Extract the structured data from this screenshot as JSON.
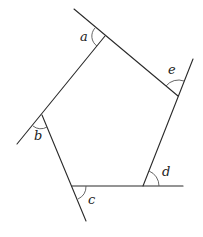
{
  "diagram": {
    "type": "pentagon-exterior-angles",
    "labels": {
      "a": "a",
      "b": "b",
      "c": "c",
      "d": "d",
      "e": "e"
    },
    "vertices": {
      "A": [
        105,
        36
      ],
      "E": [
        178,
        96
      ],
      "D": [
        143,
        186
      ],
      "C": [
        72,
        186
      ],
      "B": [
        42,
        115
      ]
    },
    "colors": {
      "line": "#2a2a2a",
      "arc": "#555555",
      "background": "#ffffff"
    }
  }
}
